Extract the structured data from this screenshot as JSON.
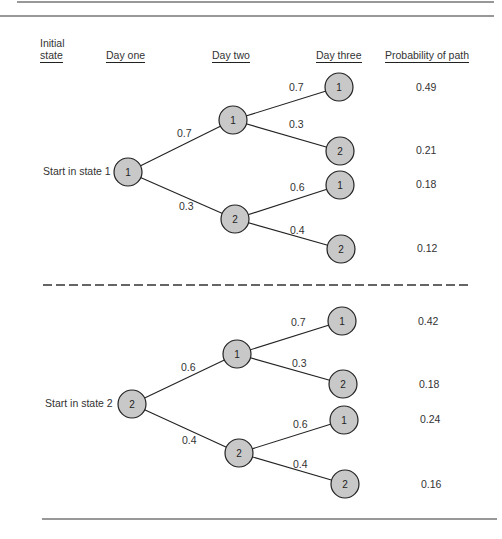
{
  "header": {
    "initial_state_line1": "Initial",
    "initial_state_line2": "state",
    "day_one": "Day one",
    "day_two": "Day two",
    "day_three": "Day three",
    "probability_of_path": "Probability of path"
  },
  "colors": {
    "node_fill": "#c8c8c8",
    "node_stroke": "#222222",
    "line": "#222222"
  },
  "trees": [
    {
      "start_label": "Start in state 1",
      "root": "1",
      "day_two": [
        {
          "state": "1",
          "prob": "0.7"
        },
        {
          "state": "2",
          "prob": "0.3"
        }
      ],
      "day_three": [
        {
          "state": "1",
          "prob": "0.7",
          "path_prob": "0.49"
        },
        {
          "state": "2",
          "prob": "0.3",
          "path_prob": "0.21"
        },
        {
          "state": "1",
          "prob": "0.6",
          "path_prob": "0.18"
        },
        {
          "state": "2",
          "prob": "0.4",
          "path_prob": "0.12"
        }
      ]
    },
    {
      "start_label": "Start in state 2",
      "root": "2",
      "day_two": [
        {
          "state": "1",
          "prob": "0.6"
        },
        {
          "state": "2",
          "prob": "0.4"
        }
      ],
      "day_three": [
        {
          "state": "1",
          "prob": "0.7",
          "path_prob": "0.42"
        },
        {
          "state": "2",
          "prob": "0.3",
          "path_prob": "0.18"
        },
        {
          "state": "1",
          "prob": "0.6",
          "path_prob": "0.24"
        },
        {
          "state": "2",
          "prob": "0.4",
          "path_prob": "0.16"
        }
      ]
    }
  ]
}
